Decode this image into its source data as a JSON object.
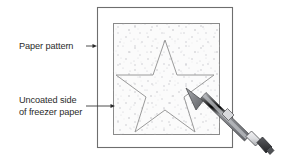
{
  "figure": {
    "background_color": "#ffffff",
    "labels": [
      {
        "id": "paper-pattern",
        "text": "Paper pattern",
        "x": 19,
        "y": 49,
        "arrow": {
          "from_x": 86,
          "from_y": 46,
          "to_x": 97,
          "to_y": 46
        }
      },
      {
        "id": "uncoated-side",
        "line1": "Uncoated side",
        "line2": "of freezer paper",
        "x": 19,
        "y": 103,
        "arrow": {
          "from_x": 86,
          "from_y": 106,
          "to_x": 115,
          "to_y": 106
        }
      }
    ],
    "outer_rect": {
      "name": "paper-pattern-sheet",
      "x": 97,
      "y": 7,
      "width": 136,
      "height": 141,
      "stroke": "#6e6e6e",
      "fill": "#ffffff"
    },
    "inner_rect": {
      "name": "freezer-paper-square",
      "x": 113,
      "y": 23,
      "width": 107,
      "height": 112,
      "stroke": "#8a8a8a",
      "fill": "#fbfbfb",
      "texture": "speckled"
    },
    "star": {
      "name": "traced-star-outline",
      "points": "165,40 177,75 214,75 184,97 195,132 165,110 135,132 146,97 116,75 153,75",
      "stroke": "#9a9a9a",
      "fill": "none"
    },
    "pen": {
      "name": "marking-pen",
      "tip_x": 186,
      "tip_y": 88,
      "end_x": 272,
      "end_y": 157,
      "barrel_color": "#8e9094",
      "barrel_shadow": "#64666b",
      "barrel_highlight": "#c9cbcf",
      "grip_color": "#e8e9eb",
      "cap_color": "#3c3d40",
      "outline_color": "#4a4b4e"
    },
    "colors": {
      "ink": "#2b2b2b",
      "line": "#6e6e6e",
      "speckle": "#c8c8cc"
    }
  }
}
